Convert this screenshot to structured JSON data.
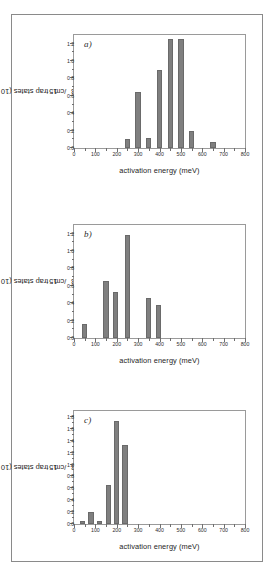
{
  "figure": {
    "bar_color": "#7f7f7f",
    "axis_color": "#9a9a9a",
    "frame_color": "#8a8a8a"
  },
  "axis_titles": {
    "x": "activation energy  (meV)",
    "y_prefix": "trap states  (10",
    "y_exponent": "15",
    "y_suffix": "/cm",
    "y_suffix_exponent": "3",
    "y_close": ")"
  },
  "chart_data": [
    {
      "type": "bar",
      "panel": "a)",
      "title": "",
      "xlabel": "activation energy  (meV)",
      "ylabel": "trap states (10^15/cm^3)",
      "xlim": [
        0,
        800
      ],
      "ylim": [
        0.0,
        1.3
      ],
      "xticks": [
        0,
        100,
        200,
        300,
        400,
        500,
        600,
        700,
        800
      ],
      "xticklabels": [
        "0",
        "100",
        "200",
        "300",
        "400",
        "500",
        "600",
        "700",
        "800"
      ],
      "yticks": [
        0.0,
        0.2,
        0.4,
        0.6,
        0.8,
        1.0,
        1.2
      ],
      "yticklabels": [
        "0.0",
        "0.2",
        "0.4",
        "0.6",
        "0.8",
        "1.0",
        "1.2"
      ],
      "grid": false,
      "bar_width": 25,
      "x": [
        250,
        300,
        350,
        400,
        450,
        500,
        550,
        650
      ],
      "values": [
        0.1,
        0.64,
        0.12,
        0.9,
        1.25,
        1.25,
        0.2,
        0.07
      ]
    },
    {
      "type": "bar",
      "panel": "b)",
      "title": "",
      "xlabel": "activation energy  (meV)",
      "ylabel": "trap states (10^15/cm^3)",
      "xlim": [
        0,
        800
      ],
      "ylim": [
        0.0,
        1.3
      ],
      "xticks": [
        0,
        100,
        200,
        300,
        400,
        500,
        600,
        700,
        800
      ],
      "xticklabels": [
        "0",
        "100",
        "200",
        "300",
        "400",
        "500",
        "600",
        "700",
        "800"
      ],
      "yticks": [
        0.0,
        0.2,
        0.4,
        0.6,
        0.8,
        1.0,
        1.2
      ],
      "yticklabels": [
        "0.0",
        "0.2",
        "0.4",
        "0.6",
        "0.8",
        "1.0",
        "1.2"
      ],
      "grid": false,
      "bar_width": 25,
      "x": [
        50,
        150,
        195,
        250,
        350,
        395
      ],
      "values": [
        0.165,
        0.655,
        0.535,
        1.18,
        0.455,
        0.38
      ]
    },
    {
      "type": "bar",
      "panel": "c)",
      "title": "",
      "xlabel": "activation energy  (meV)",
      "ylabel": "trap states (10^15/cm^3)",
      "xlim": [
        0,
        800
      ],
      "ylim": [
        0.0,
        1.9
      ],
      "xticks": [
        0,
        100,
        200,
        300,
        400,
        500,
        600,
        700,
        800
      ],
      "xticklabels": [
        "0",
        "100",
        "200",
        "300",
        "400",
        "500",
        "600",
        "700",
        "800"
      ],
      "yticks": [
        0.0,
        0.2,
        0.4,
        0.6,
        0.8,
        1.0,
        1.2,
        1.4,
        1.6,
        1.8
      ],
      "yticklabels": [
        "0.0",
        "0.2",
        "0.4",
        "0.6",
        "0.8",
        "1.0",
        "1.2",
        "1.4",
        "1.6",
        "1.8"
      ],
      "grid": false,
      "bar_width": 25,
      "x": [
        40,
        80,
        118,
        160,
        200,
        238
      ],
      "values": [
        0.05,
        0.195,
        0.05,
        0.655,
        1.74,
        1.33
      ]
    }
  ]
}
